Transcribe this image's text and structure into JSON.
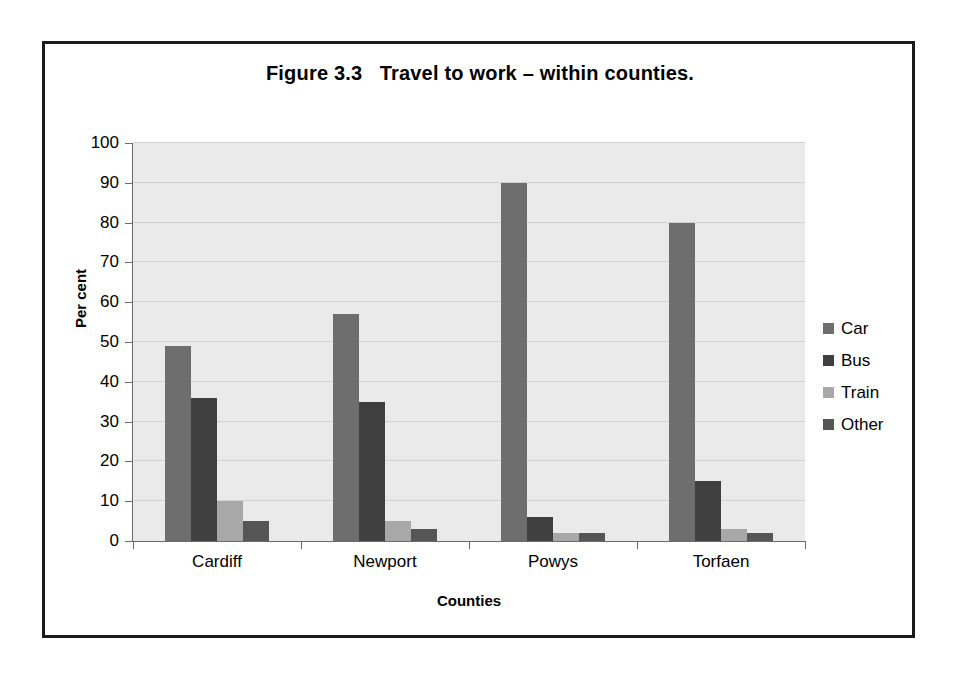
{
  "chart_data": {
    "type": "bar",
    "title": "Figure 3.3   Travel to work – within counties.",
    "xlabel": "Counties",
    "ylabel": "Per cent",
    "categories": [
      "Cardiff",
      "Newport",
      "Powys",
      "Torfaen"
    ],
    "series": [
      {
        "name": "Car",
        "values": [
          49,
          57,
          90,
          80
        ],
        "color": "#6e6e6e"
      },
      {
        "name": "Bus",
        "values": [
          36,
          35,
          6,
          15
        ],
        "color": "#3f3f3f"
      },
      {
        "name": "Train",
        "values": [
          10,
          5,
          2,
          3
        ],
        "color": "#a8a8a8"
      },
      {
        "name": "Other",
        "values": [
          5,
          3,
          2,
          2
        ],
        "color": "#565656"
      }
    ],
    "ylim": [
      0,
      100
    ],
    "yticks": [
      0,
      10,
      20,
      30,
      40,
      50,
      60,
      70,
      80,
      90,
      100
    ],
    "ytick_labels": [
      "0",
      "10",
      "20",
      "30",
      "40",
      "50",
      "60",
      "70",
      "80",
      "90",
      "100"
    ],
    "grid": true,
    "legend_position": "right",
    "plot_background": "#eaeaea",
    "gridline_color": "#d2d2d2",
    "axis_color": "#6b6b6b",
    "frame_color": "#1a1a1a",
    "text_color": "#000000"
  }
}
